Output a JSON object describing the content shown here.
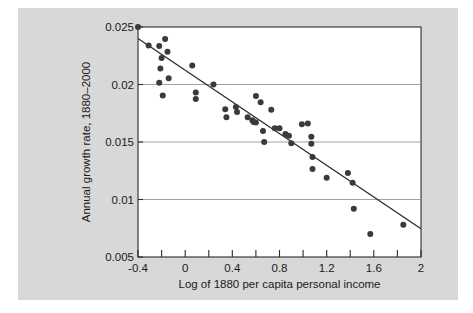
{
  "figure": {
    "background_color": "#d8d8d8",
    "plot_background_color": "#ffffff",
    "point_color": "#3a3a3a",
    "line_color": "#2b2b2b",
    "grid_color": "#8a8a8a"
  },
  "chart_data": {
    "type": "scatter",
    "title": "",
    "subtitle": "",
    "xlabel": "Log of 1880 per capita personal income",
    "ylabel": "Annual growth rate, 1880–2000",
    "xlim": [
      -0.4,
      2
    ],
    "ylim": [
      0.005,
      0.025
    ],
    "xticks": [
      -0.4,
      0,
      0.4,
      0.8,
      1.2,
      1.6,
      2
    ],
    "xtick_labels": [
      "-0.4",
      "0",
      "0.4",
      "0.8",
      "1.2",
      "1.6",
      "2"
    ],
    "xminor_ticks": [
      -0.2,
      0.2,
      0.6,
      1.0,
      1.4,
      1.8
    ],
    "yticks": [
      0.005,
      0.01,
      0.015,
      0.02,
      0.025
    ],
    "ytick_labels": [
      "0.005",
      "0.01",
      "0.015",
      "0.02",
      "0.025"
    ],
    "grid": "horizontal",
    "gridlines_y": [
      0.01,
      0.015,
      0.02
    ],
    "legend": "none",
    "legend_position": "none",
    "marker": "filled-circle",
    "marker_size_px": 3.0,
    "series": [
      {
        "name": "US states",
        "type": "scatter",
        "points": [
          [
            -0.4,
            0.025
          ],
          [
            -0.31,
            0.0234
          ],
          [
            -0.22,
            0.02335
          ],
          [
            -0.21,
            0.0214
          ],
          [
            -0.22,
            0.02015
          ],
          [
            -0.2,
            0.0223
          ],
          [
            -0.19,
            0.01905
          ],
          [
            -0.17,
            0.02395
          ],
          [
            -0.15,
            0.02285
          ],
          [
            -0.14,
            0.02055
          ],
          [
            0.06,
            0.02165
          ],
          [
            0.09,
            0.0193
          ],
          [
            0.09,
            0.01875
          ],
          [
            0.24,
            0.02
          ],
          [
            0.34,
            0.01785
          ],
          [
            0.35,
            0.01715
          ],
          [
            0.43,
            0.01805
          ],
          [
            0.44,
            0.0176
          ],
          [
            0.53,
            0.01715
          ],
          [
            0.57,
            0.0169
          ],
          [
            0.58,
            0.01675
          ],
          [
            0.6,
            0.0167
          ],
          [
            0.6,
            0.019
          ],
          [
            0.64,
            0.01845
          ],
          [
            0.66,
            0.01595
          ],
          [
            0.67,
            0.015
          ],
          [
            0.73,
            0.0178
          ],
          [
            0.76,
            0.0162
          ],
          [
            0.8,
            0.0162
          ],
          [
            0.85,
            0.0157
          ],
          [
            0.88,
            0.01555
          ],
          [
            0.9,
            0.0149
          ],
          [
            0.99,
            0.01655
          ],
          [
            1.04,
            0.0166
          ],
          [
            1.07,
            0.01545
          ],
          [
            1.07,
            0.01485
          ],
          [
            1.08,
            0.0137
          ],
          [
            1.08,
            0.01265
          ],
          [
            1.2,
            0.0119
          ],
          [
            1.38,
            0.0123
          ],
          [
            1.42,
            0.01145
          ],
          [
            1.43,
            0.0092
          ],
          [
            1.57,
            0.007
          ],
          [
            1.85,
            0.0078
          ]
        ]
      }
    ],
    "fit_line": {
      "name": "regression line",
      "type": "line",
      "x_start": -0.4,
      "y_start": 0.024,
      "x_end": 2.0,
      "y_end": 0.00745,
      "slope": -0.0068958,
      "intercept": 0.0212417
    }
  }
}
